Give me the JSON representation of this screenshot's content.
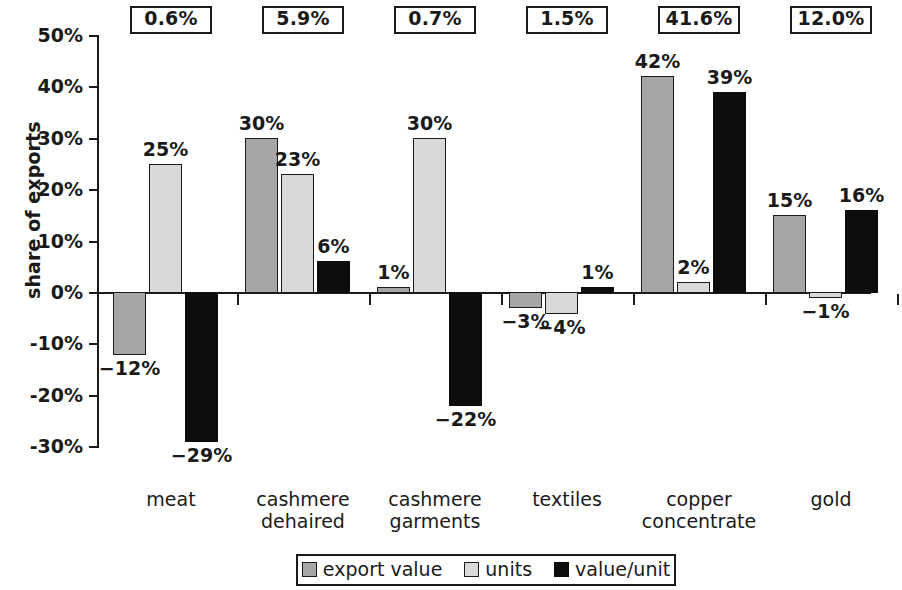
{
  "chart_data": {
    "type": "bar",
    "title": "",
    "xlabel": "",
    "ylabel": "share of exports",
    "ylim": [
      -30,
      50
    ],
    "ytick_labels": [
      "50%",
      "40%",
      "30%",
      "20%",
      "10%",
      "0%",
      "-10%",
      "-20%",
      "-30%"
    ],
    "ytick_values": [
      50,
      40,
      30,
      20,
      10,
      0,
      -10,
      -20,
      -30
    ],
    "grid": false,
    "legend_position": "bottom",
    "categories": [
      "meat",
      "cashmere\ndehaired",
      "cashmere\ngarments",
      "textiles",
      "copper\nconcentrate",
      "gold"
    ],
    "series": [
      {
        "name": "export value",
        "key": "export_value",
        "color": "#a6a6a6",
        "values": [
          -12,
          30,
          1,
          -3,
          42,
          15
        ],
        "labels": [
          "−12%",
          "30%",
          "1%",
          "−3%",
          "42%",
          "15%"
        ]
      },
      {
        "name": "units",
        "key": "units",
        "color": "#d9d9d9",
        "values": [
          25,
          23,
          30,
          -4,
          2,
          -1
        ],
        "labels": [
          "25%",
          "23%",
          "30%",
          "−4%",
          "2%",
          "−1%"
        ]
      },
      {
        "name": "value/unit",
        "key": "value_unit",
        "color": "#0d0d0d",
        "values": [
          -29,
          6,
          -22,
          1,
          39,
          16
        ],
        "labels": [
          "−29%",
          "6%",
          "−22%",
          "1%",
          "39%",
          "16%"
        ]
      }
    ],
    "annotations": {
      "description": "boxed share-of-total-exports value above each category",
      "values": [
        "0.6%",
        "5.9%",
        "0.7%",
        "1.5%",
        "41.6%",
        "12.0%"
      ]
    }
  }
}
